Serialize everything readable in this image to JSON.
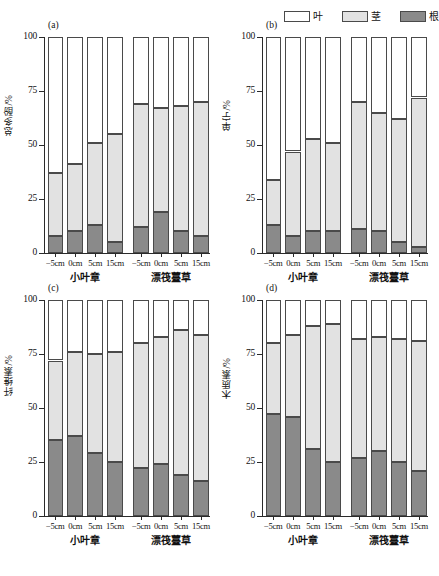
{
  "legend": {
    "items": [
      {
        "label": "叶",
        "color": "#ffffff",
        "name": "leaf"
      },
      {
        "label": "茎",
        "color": "#e2e2e2",
        "name": "stem"
      },
      {
        "label": "根",
        "color": "#8a8a8a",
        "name": "root"
      }
    ]
  },
  "colors": {
    "leaf": "#ffffff",
    "stem": "#e2e2e2",
    "root": "#8a8a8a",
    "outline": "#4a4a4a",
    "axis": "#2a2a2a"
  },
  "axis": {
    "yticks": [
      0,
      25,
      50,
      75,
      100
    ],
    "ytick_labels": [
      "0",
      "25",
      "50",
      "75",
      "100"
    ],
    "ylim": [
      0,
      100
    ],
    "xtick_labels": [
      "−5cm",
      "0cm",
      "5cm",
      "15cm",
      "−5cm",
      "0cm",
      "5cm",
      "15cm"
    ],
    "group_labels": [
      "小叶章",
      "漂筏薹草"
    ]
  },
  "chart_data": [
    {
      "type": "bar",
      "panel": "(a)",
      "title": "",
      "ylabel": "总多酚/%",
      "xlabel": "",
      "ylim": [
        0,
        100
      ],
      "grid": false,
      "stacked": true,
      "legend_position": "top-right",
      "categories": [
        "−5cm",
        "0cm",
        "5cm",
        "15cm",
        "−5cm",
        "0cm",
        "5cm",
        "15cm"
      ],
      "groups": [
        "小叶章",
        "小叶章",
        "小叶章",
        "小叶章",
        "漂筏薹草",
        "漂筏薹草",
        "漂筏薹草",
        "漂筏薹草"
      ],
      "series": [
        {
          "name": "根",
          "values": [
            8,
            10,
            13,
            5,
            12,
            19,
            10,
            8
          ]
        },
        {
          "name": "茎",
          "values": [
            29,
            31,
            38,
            50,
            57,
            48,
            58,
            62
          ]
        },
        {
          "name": "叶",
          "values": [
            63,
            59,
            49,
            45,
            31,
            33,
            32,
            30
          ]
        }
      ],
      "cumulative_tops": {
        "root": [
          8,
          10,
          13,
          5,
          12,
          19,
          10,
          8
        ],
        "stem": [
          37,
          41,
          51,
          55,
          69,
          67,
          68,
          70
        ]
      }
    },
    {
      "type": "bar",
      "panel": "(b)",
      "title": "",
      "ylabel": "单宁/%",
      "xlabel": "",
      "ylim": [
        0,
        100
      ],
      "grid": false,
      "stacked": true,
      "legend_position": "top-right",
      "categories": [
        "−5cm",
        "0cm",
        "5cm",
        "15cm",
        "−5cm",
        "0cm",
        "5cm",
        "15cm"
      ],
      "groups": [
        "小叶章",
        "小叶章",
        "小叶章",
        "小叶章",
        "漂筏薹草",
        "漂筏薹草",
        "漂筏薹草",
        "漂筏薹草"
      ],
      "series": [
        {
          "name": "根",
          "values": [
            13,
            8,
            10,
            10,
            11,
            10,
            5,
            3
          ]
        },
        {
          "name": "茎",
          "values": [
            21,
            39,
            43,
            41,
            59,
            55,
            57,
            69
          ]
        },
        {
          "name": "叶",
          "values": [
            66,
            53,
            47,
            49,
            30,
            35,
            38,
            28
          ]
        }
      ],
      "cumulative_tops": {
        "root": [
          13,
          8,
          10,
          10,
          11,
          10,
          5,
          3
        ],
        "stem": [
          34,
          47,
          53,
          51,
          70,
          65,
          62,
          72
        ]
      }
    },
    {
      "type": "bar",
      "panel": "(c)",
      "title": "",
      "ylabel": "纤维素/%",
      "xlabel": "",
      "ylim": [
        0,
        100
      ],
      "grid": false,
      "stacked": true,
      "legend_position": "none",
      "categories": [
        "−5cm",
        "0cm",
        "5cm",
        "15cm",
        "−5cm",
        "0cm",
        "5cm",
        "15cm"
      ],
      "groups": [
        "小叶章",
        "小叶章",
        "小叶章",
        "小叶章",
        "漂筏薹草",
        "漂筏薹草",
        "漂筏薹草",
        "漂筏薹草"
      ],
      "series": [
        {
          "name": "根",
          "values": [
            35,
            37,
            29,
            25,
            22,
            24,
            19,
            16
          ]
        },
        {
          "name": "茎",
          "values": [
            37,
            39,
            46,
            51,
            58,
            59,
            67,
            68
          ]
        },
        {
          "name": "叶",
          "values": [
            28,
            24,
            25,
            24,
            20,
            17,
            14,
            16
          ]
        }
      ],
      "cumulative_tops": {
        "root": [
          35,
          37,
          29,
          25,
          22,
          24,
          19,
          16
        ],
        "stem": [
          72,
          76,
          75,
          76,
          80,
          83,
          86,
          84
        ]
      }
    },
    {
      "type": "bar",
      "panel": "(d)",
      "title": "",
      "ylabel": "木质素/%",
      "xlabel": "",
      "ylim": [
        0,
        100
      ],
      "grid": false,
      "stacked": true,
      "legend_position": "none",
      "categories": [
        "−5cm",
        "0cm",
        "5cm",
        "15cm",
        "−5cm",
        "0cm",
        "5cm",
        "15cm"
      ],
      "groups": [
        "小叶章",
        "小叶章",
        "小叶章",
        "小叶章",
        "漂筏薹草",
        "漂筏薹草",
        "漂筏薹草",
        "漂筏薹草"
      ],
      "series": [
        {
          "name": "根",
          "values": [
            47,
            46,
            31,
            25,
            27,
            30,
            25,
            21
          ]
        },
        {
          "name": "茎",
          "values": [
            33,
            38,
            57,
            64,
            55,
            53,
            57,
            60
          ]
        },
        {
          "name": "叶",
          "values": [
            20,
            16,
            12,
            11,
            18,
            17,
            18,
            19
          ]
        }
      ],
      "cumulative_tops": {
        "root": [
          47,
          46,
          31,
          25,
          27,
          30,
          25,
          21
        ],
        "stem": [
          80,
          84,
          88,
          89,
          82,
          83,
          82,
          81
        ]
      }
    }
  ],
  "caption": ""
}
